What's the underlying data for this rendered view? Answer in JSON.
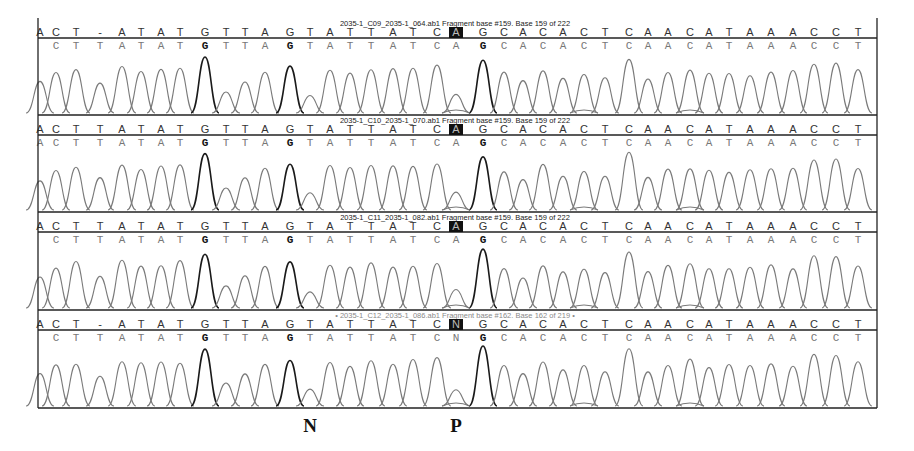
{
  "chart_data": {
    "type": "chromatogram",
    "title": "",
    "panels": [
      {
        "title": "2035-1_C09_2035-1_064.ab1 Fragment base #159. Base 159 of 222",
        "reference_sequence": [
          "A",
          "C",
          "T",
          "-",
          "A",
          "T",
          "A",
          "T",
          "G",
          "T",
          "T",
          "A",
          "G",
          "T",
          "A",
          "T",
          "T",
          "A",
          "T",
          "C",
          "A",
          "G",
          "C",
          "A",
          "C",
          "A",
          "C",
          "T",
          "C",
          "A",
          "A",
          "C",
          "A",
          "T",
          "A",
          "A",
          "A",
          "C",
          "C",
          "T"
        ],
        "base_calls": [
          "",
          "C",
          "T",
          "T",
          "A",
          "T",
          "A",
          "T",
          "G",
          "T",
          "T",
          "A",
          "G",
          "T",
          "A",
          "T",
          "T",
          "A",
          "T",
          "C",
          "A",
          "G",
          "C",
          "A",
          "C",
          "A",
          "C",
          "T",
          "C",
          "A",
          "A",
          "C",
          "A",
          "T",
          "A",
          "A",
          "A",
          "C",
          "C",
          "T"
        ],
        "highlighted_base": {
          "index": 20,
          "value": "A"
        },
        "faded_title": false
      },
      {
        "title": "2035-1_C10_2035-1_070.ab1 Fragment base #159. Base 159 of 222",
        "reference_sequence": [
          "A",
          "C",
          "T",
          "T",
          "A",
          "T",
          "A",
          "T",
          "G",
          "T",
          "T",
          "A",
          "G",
          "T",
          "A",
          "T",
          "T",
          "A",
          "T",
          "C",
          "A",
          "G",
          "C",
          "A",
          "C",
          "A",
          "C",
          "T",
          "C",
          "A",
          "A",
          "C",
          "A",
          "T",
          "A",
          "A",
          "A",
          "C",
          "C",
          "T"
        ],
        "base_calls": [
          "A",
          "C",
          "T",
          "T",
          "A",
          "T",
          "A",
          "T",
          "G",
          "T",
          "T",
          "A",
          "G",
          "T",
          "A",
          "T",
          "T",
          "A",
          "T",
          "C",
          "A",
          "G",
          "C",
          "A",
          "C",
          "A",
          "C",
          "T",
          "C",
          "A",
          "A",
          "C",
          "A",
          "T",
          "A",
          "A",
          "A",
          "C",
          "C",
          "T"
        ],
        "highlighted_base": {
          "index": 20,
          "value": "A"
        },
        "faded_title": false
      },
      {
        "title": "2035-1_C11_2035-1_082.ab1 Fragment base #159. Base 159 of 222",
        "reference_sequence": [
          "A",
          "C",
          "T",
          "T",
          "A",
          "T",
          "A",
          "T",
          "G",
          "T",
          "T",
          "A",
          "G",
          "T",
          "A",
          "T",
          "T",
          "A",
          "T",
          "C",
          "A",
          "G",
          "C",
          "A",
          "C",
          "A",
          "C",
          "T",
          "C",
          "A",
          "A",
          "C",
          "A",
          "T",
          "A",
          "A",
          "A",
          "C",
          "C",
          "T"
        ],
        "base_calls": [
          "",
          "C",
          "T",
          "T",
          "A",
          "T",
          "A",
          "T",
          "G",
          "T",
          "T",
          "A",
          "G",
          "T",
          "A",
          "T",
          "T",
          "A",
          "T",
          "C",
          "A",
          "G",
          "C",
          "A",
          "C",
          "A",
          "C",
          "T",
          "C",
          "A",
          "A",
          "C",
          "A",
          "T",
          "A",
          "A",
          "A",
          "C",
          "C",
          "T"
        ],
        "highlighted_base": {
          "index": 20,
          "value": "A"
        },
        "faded_title": false
      },
      {
        "title": "• 2035-1_C12_2035-1_086.ab1 Fragment base #162. Base 162 of 219 •",
        "reference_sequence": [
          "A",
          "C",
          "T",
          "-",
          "A",
          "T",
          "A",
          "T",
          "G",
          "T",
          "T",
          "A",
          "G",
          "T",
          "A",
          "T",
          "T",
          "A",
          "T",
          "C",
          "N",
          "G",
          "C",
          "A",
          "C",
          "A",
          "C",
          "T",
          "C",
          "A",
          "A",
          "C",
          "A",
          "T",
          "A",
          "A",
          "A",
          "C",
          "C",
          "T"
        ],
        "base_calls": [
          "",
          "C",
          "T",
          "T",
          "A",
          "T",
          "A",
          "T",
          "G",
          "T",
          "T",
          "A",
          "G",
          "T",
          "A",
          "T",
          "T",
          "A",
          "T",
          "C",
          "N",
          "G",
          "C",
          "A",
          "C",
          "A",
          "C",
          "T",
          "C",
          "A",
          "A",
          "C",
          "A",
          "T",
          "A",
          "A",
          "A",
          "C",
          "C",
          "T"
        ],
        "highlighted_base": {
          "index": 20,
          "value": "N"
        },
        "faded_title": true
      }
    ],
    "bold_positions": [
      8,
      12,
      21
    ],
    "annotations": [
      {
        "label": "N",
        "position_index": 13
      },
      {
        "label": "P",
        "position_index": 20
      }
    ],
    "xlabel": "",
    "ylabel": "",
    "grid": false,
    "legend": null
  }
}
